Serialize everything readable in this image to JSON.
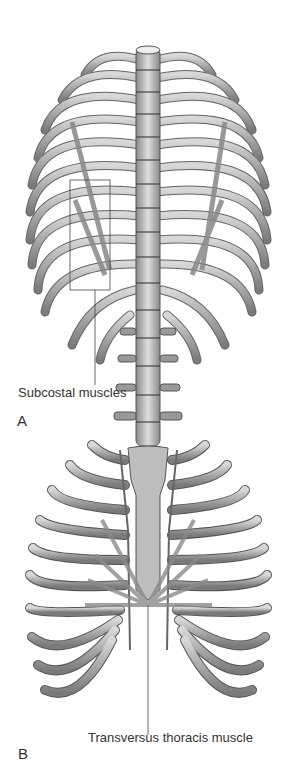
{
  "figure": {
    "panels": [
      {
        "id": "A",
        "letter": "A",
        "view": "posterior thoracic cage",
        "label": "Subcostal muscles"
      },
      {
        "id": "B",
        "letter": "B",
        "view": "anterior thoracic cage (internal)",
        "label": "Transversus thoracis muscle"
      }
    ]
  },
  "colors": {
    "bone": "#b8b8b8",
    "bone_dark": "#6e6e6e",
    "outline": "#444444",
    "muscle": "#9a9a9a",
    "text": "#333333"
  }
}
